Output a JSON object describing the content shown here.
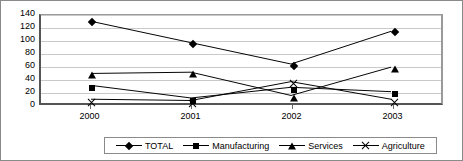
{
  "chart_data": {
    "type": "line",
    "title": "",
    "xlabel": "",
    "ylabel": "",
    "categories": [
      "2000",
      "2001",
      "2002",
      "2003"
    ],
    "ylim": [
      0,
      140
    ],
    "yticks": [
      0,
      20,
      40,
      60,
      80,
      100,
      120,
      140
    ],
    "grid": true,
    "legend_position": "bottom",
    "series": [
      {
        "name": "TOTAL",
        "marker": "diamond",
        "values": [
          130,
          96,
          62,
          114
        ]
      },
      {
        "name": "Manufacturing",
        "marker": "square",
        "values": [
          28,
          8,
          25,
          18
        ]
      },
      {
        "name": "Services",
        "marker": "triangle",
        "values": [
          47,
          49,
          12,
          57
        ]
      },
      {
        "name": "Agriculture",
        "marker": "cross",
        "values": [
          6,
          4,
          34,
          6
        ]
      }
    ]
  },
  "axis": {
    "y_tick_labels": [
      "140",
      "120",
      "100",
      "80",
      "60",
      "40",
      "20",
      "0"
    ],
    "x_tick_labels": [
      "2000",
      "2001",
      "2002",
      "2003"
    ]
  },
  "legend": {
    "items": [
      {
        "label": "TOTAL",
        "marker": "diamond-marker-icon"
      },
      {
        "label": "Manufacturing",
        "marker": "square-marker-icon"
      },
      {
        "label": "Services",
        "marker": "triangle-marker-icon"
      },
      {
        "label": "Agriculture",
        "marker": "cross-marker-icon"
      }
    ]
  },
  "colors": {
    "series_line": "#000000",
    "gridline": "#c9c9c9",
    "axis": "#555555",
    "background": "#ffffff"
  }
}
